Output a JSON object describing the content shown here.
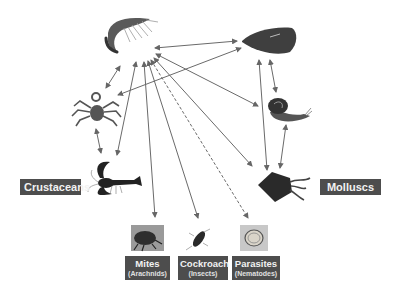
{
  "diagram": {
    "type": "cross-reactivity network",
    "groups": [
      {
        "id": "crustaceans",
        "label": "Crustaceans"
      },
      {
        "id": "molluscs",
        "label": "Molluscs"
      }
    ],
    "nodes": [
      {
        "id": "shrimp",
        "icon": "shrimp-icon",
        "group": "crustaceans"
      },
      {
        "id": "crab",
        "icon": "crab-icon",
        "group": "crustaceans"
      },
      {
        "id": "lobster",
        "icon": "lobster-icon",
        "group": "crustaceans"
      },
      {
        "id": "mussel",
        "icon": "mussel-icon",
        "group": "molluscs"
      },
      {
        "id": "snail",
        "icon": "snail-icon",
        "group": "molluscs"
      },
      {
        "id": "squid",
        "icon": "squid-icon",
        "group": "molluscs"
      },
      {
        "id": "mites",
        "icon": "mite-icon",
        "label": "Mites",
        "sublabel": "(Arachnids)"
      },
      {
        "id": "cockroach",
        "icon": "cockroach-icon",
        "label": "Cockroach",
        "sublabel": "(Insects)"
      },
      {
        "id": "parasites",
        "icon": "nematode-icon",
        "label": "Parasites",
        "sublabel": "(Nematodes)"
      }
    ],
    "edges": [
      {
        "from": "shrimp",
        "to": "mussel",
        "style": "solid",
        "direction": "both"
      },
      {
        "from": "shrimp",
        "to": "crab",
        "style": "solid",
        "direction": "both"
      },
      {
        "from": "shrimp",
        "to": "lobster",
        "style": "solid",
        "direction": "both"
      },
      {
        "from": "shrimp",
        "to": "snail",
        "style": "solid",
        "direction": "both"
      },
      {
        "from": "shrimp",
        "to": "squid",
        "style": "solid",
        "direction": "both"
      },
      {
        "from": "shrimp",
        "to": "mites",
        "style": "solid",
        "direction": "both"
      },
      {
        "from": "shrimp",
        "to": "cockroach",
        "style": "solid",
        "direction": "both"
      },
      {
        "from": "shrimp",
        "to": "parasites",
        "style": "dashed",
        "direction": "both"
      },
      {
        "from": "mussel",
        "to": "crab",
        "style": "solid",
        "direction": "both"
      },
      {
        "from": "mussel",
        "to": "snail",
        "style": "solid",
        "direction": "both"
      },
      {
        "from": "mussel",
        "to": "squid",
        "style": "solid",
        "direction": "both"
      },
      {
        "from": "crab",
        "to": "lobster",
        "style": "solid",
        "direction": "both"
      },
      {
        "from": "snail",
        "to": "squid",
        "style": "solid",
        "direction": "both"
      }
    ],
    "colors": {
      "label_bg": "#4d4d4d",
      "label_text": "#f2f2f2",
      "arrow": "#666666",
      "background": "#ffffff"
    }
  }
}
